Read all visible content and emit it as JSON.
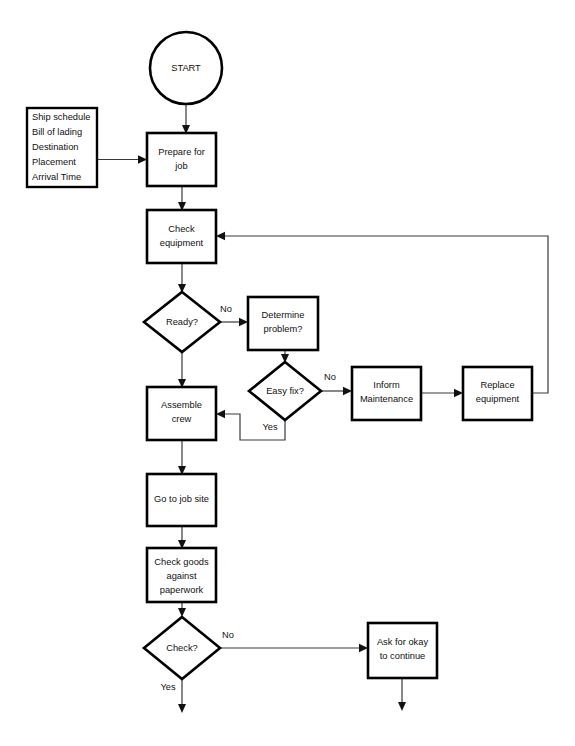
{
  "diagram": {
    "type": "flowchart",
    "canvas": {
      "width": 575,
      "height": 746
    },
    "colors": {
      "background": "#ffffff",
      "node_stroke": "#000000",
      "node_fill": "#ffffff",
      "connector": "#3a3a3a",
      "text": "#111111"
    },
    "nodes": [
      {
        "id": "start",
        "shape": "circle",
        "label": "START",
        "lines": [
          "START"
        ],
        "cx": 186,
        "cy": 68,
        "r": 36
      },
      {
        "id": "inputs",
        "shape": "rectangle",
        "label": "Ship schedule / Bill of lading / Destination / Placement / Arrival Time",
        "lines": [
          "Ship schedule",
          "Bill of lading",
          "Destination",
          "Placement",
          "Arrival Time"
        ],
        "x": 27,
        "y": 108,
        "w": 70,
        "h": 79
      },
      {
        "id": "prepare-for-job",
        "shape": "rectangle",
        "label": "Prepare for job",
        "lines": [
          "Prepare for",
          "job"
        ],
        "x": 147,
        "y": 133,
        "w": 69,
        "h": 53
      },
      {
        "id": "check-equipment",
        "shape": "rectangle",
        "label": "Check equipment",
        "lines": [
          "Check",
          "equipment"
        ],
        "x": 147,
        "y": 210,
        "w": 69,
        "h": 53
      },
      {
        "id": "ready",
        "shape": "diamond",
        "label": "Ready?",
        "lines": [
          "Ready?"
        ],
        "cx": 182,
        "cy": 322,
        "rx": 38,
        "ry": 30
      },
      {
        "id": "determine-problem",
        "shape": "rectangle",
        "label": "Determine problem?",
        "lines": [
          "Determine",
          "problem?"
        ],
        "x": 248,
        "y": 297,
        "w": 70,
        "h": 53
      },
      {
        "id": "easy-fix",
        "shape": "diamond",
        "label": "Easy fix?",
        "lines": [
          "Easy fix?"
        ],
        "cx": 285,
        "cy": 391,
        "rx": 36,
        "ry": 29
      },
      {
        "id": "inform-maintenance",
        "shape": "rectangle",
        "label": "Inform Maintenance",
        "lines": [
          "Inform",
          "Maintenance"
        ],
        "x": 352,
        "y": 367,
        "w": 69,
        "h": 53
      },
      {
        "id": "replace-equipment",
        "shape": "rectangle",
        "label": "Replace equipment",
        "lines": [
          "Replace",
          "equipment"
        ],
        "x": 463,
        "y": 367,
        "w": 69,
        "h": 53
      },
      {
        "id": "assemble-crew",
        "shape": "rectangle",
        "label": "Assemble crew",
        "lines": [
          "Assemble",
          "crew"
        ],
        "x": 147,
        "y": 387,
        "w": 69,
        "h": 53
      },
      {
        "id": "go-to-job-site",
        "shape": "rectangle",
        "label": "Go to job site",
        "lines": [
          "Go to job site"
        ],
        "x": 147,
        "y": 474,
        "w": 69,
        "h": 52
      },
      {
        "id": "check-goods",
        "shape": "rectangle",
        "label": "Check goods against paperwork",
        "lines": [
          "Check goods",
          "against",
          "paperwork"
        ],
        "x": 147,
        "y": 548,
        "w": 69,
        "h": 54
      },
      {
        "id": "check",
        "shape": "diamond",
        "label": "Check?",
        "lines": [
          "Check?"
        ],
        "cx": 182,
        "cy": 648,
        "rx": 38,
        "ry": 31
      },
      {
        "id": "ask-for-okay",
        "shape": "rectangle",
        "label": "Ask for okay to continue",
        "lines": [
          "Ask for okay",
          "to continue"
        ],
        "x": 368,
        "y": 623,
        "w": 69,
        "h": 55
      }
    ],
    "edges": [
      {
        "id": "start-to-prepare",
        "from": "start",
        "to": "prepare-for-job",
        "label": ""
      },
      {
        "id": "inputs-to-prepare",
        "from": "inputs",
        "to": "prepare-for-job",
        "label": ""
      },
      {
        "id": "prepare-to-check-equipment",
        "from": "prepare-for-job",
        "to": "check-equipment",
        "label": ""
      },
      {
        "id": "check-equipment-to-ready",
        "from": "check-equipment",
        "to": "ready",
        "label": ""
      },
      {
        "id": "ready-no-to-determine",
        "from": "ready",
        "to": "determine-problem",
        "label": "No"
      },
      {
        "id": "ready-to-assemble",
        "from": "ready",
        "to": "assemble-crew",
        "label": ""
      },
      {
        "id": "determine-to-easy-fix",
        "from": "determine-problem",
        "to": "easy-fix",
        "label": ""
      },
      {
        "id": "easy-fix-no-to-inform",
        "from": "easy-fix",
        "to": "inform-maintenance",
        "label": "No"
      },
      {
        "id": "easy-fix-yes-to-assemble",
        "from": "easy-fix",
        "to": "assemble-crew",
        "label": "Yes"
      },
      {
        "id": "inform-to-replace",
        "from": "inform-maintenance",
        "to": "replace-equipment",
        "label": ""
      },
      {
        "id": "replace-to-check-equipment",
        "from": "replace-equipment",
        "to": "check-equipment",
        "label": ""
      },
      {
        "id": "assemble-to-job-site",
        "from": "assemble-crew",
        "to": "go-to-job-site",
        "label": ""
      },
      {
        "id": "job-site-to-check-goods",
        "from": "go-to-job-site",
        "to": "check-goods",
        "label": ""
      },
      {
        "id": "check-goods-to-check",
        "from": "check-goods",
        "to": "check",
        "label": ""
      },
      {
        "id": "check-no-to-ask",
        "from": "check",
        "to": "ask-for-okay",
        "label": "No"
      },
      {
        "id": "check-yes-continue",
        "from": "check",
        "to": "",
        "label": "Yes"
      },
      {
        "id": "ask-continue-down",
        "from": "ask-for-okay",
        "to": "",
        "label": ""
      }
    ],
    "edge_labels": {
      "ready_no": "No",
      "easy_fix_no": "No",
      "easy_fix_yes": "Yes",
      "check_no": "No",
      "check_yes": "Yes"
    }
  }
}
